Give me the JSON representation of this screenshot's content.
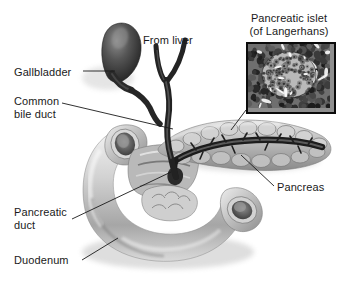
{
  "figure": {
    "title_visible": false,
    "type": "anatomical-illustration",
    "style": "grayscale airbrush medical illustration on white background",
    "background_color": "#ffffff",
    "ink_color": "#1a1a1a"
  },
  "labels": [
    {
      "id": "gallbladder",
      "text": "Gallbladder",
      "x": 14,
      "y": 66,
      "align": "left",
      "leader": true
    },
    {
      "id": "common-bile-duct",
      "text": "Common\nbile duct",
      "x": 14,
      "y": 95,
      "align": "left",
      "leader": true
    },
    {
      "id": "from-liver",
      "text": "From liver",
      "x": 143,
      "y": 34,
      "align": "left",
      "leader": false
    },
    {
      "id": "pancreatic-islet",
      "text": "Pancreatic islet\n(of Langerhans)",
      "x": 243,
      "y": 12,
      "align": "center",
      "leader": true
    },
    {
      "id": "pancreas",
      "text": "Pancreas",
      "x": 277,
      "y": 181,
      "align": "left",
      "leader": true
    },
    {
      "id": "pancreatic-duct",
      "text": "Pancreatic\nduct",
      "x": 14,
      "y": 206,
      "align": "left",
      "leader": true
    },
    {
      "id": "duodenum",
      "text": "Duodenum",
      "x": 14,
      "y": 254,
      "align": "left",
      "leader": true
    }
  ],
  "leader_lines": [
    {
      "id": "leader-gallbladder",
      "from": [
        83,
        71
      ],
      "to": [
        115,
        71
      ]
    },
    {
      "id": "leader-common-bile-duct",
      "from": [
        62,
        103
      ],
      "to": [
        173,
        129
      ]
    },
    {
      "id": "leader-islet",
      "from": [
        246,
        110
      ],
      "to": [
        231,
        130
      ]
    },
    {
      "id": "leader-pancreas",
      "from": [
        274,
        186
      ],
      "to": [
        241,
        155
      ]
    },
    {
      "id": "leader-pancreatic-duct",
      "from": [
        72,
        219
      ],
      "to": [
        171,
        172
      ]
    },
    {
      "id": "leader-duodenum",
      "from": [
        82,
        260
      ],
      "to": [
        118,
        238
      ]
    }
  ],
  "inset": {
    "id": "islet-micrograph",
    "caption_line1": "Pancreatic islet",
    "caption_line2": "(of Langerhans)",
    "box": {
      "x": 246,
      "y": 42,
      "width": 86,
      "height": 68
    },
    "border_color": "#0b0b0b",
    "description": "grayscale histology micrograph: round pale islet of endocrine cells surrounded by darker acinar tissue and white capillary clefts"
  },
  "structures": [
    {
      "id": "gallbladder-body",
      "name": "Gallbladder",
      "tone": "#4a4a4a"
    },
    {
      "id": "hepatic-ducts",
      "name": "Ducts from liver",
      "tone": "#3b3b3b"
    },
    {
      "id": "common-bile-duct",
      "name": "Common bile duct",
      "tone": "#3b3b3b"
    },
    {
      "id": "duodenum-loop",
      "name": "Duodenum",
      "tone": "#c9c9c9"
    },
    {
      "id": "pancreas-body",
      "name": "Pancreas",
      "tone": "#b5b5b5"
    },
    {
      "id": "pancreatic-duct",
      "name": "Pancreatic duct",
      "tone": "#2e2e2e"
    }
  ]
}
